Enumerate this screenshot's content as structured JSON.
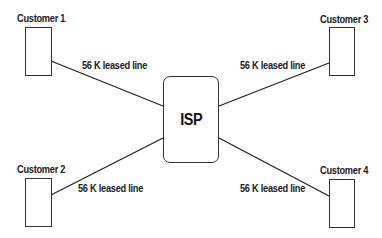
{
  "diagram": {
    "hub": {
      "label": "ISP"
    },
    "nodes": [
      {
        "id": "customer1",
        "label": "Customer 1"
      },
      {
        "id": "customer2",
        "label": "Customer 2"
      },
      {
        "id": "customer3",
        "label": "Customer 3"
      },
      {
        "id": "customer4",
        "label": "Customer 4"
      }
    ],
    "links": [
      {
        "from": "customer1",
        "to": "ISP",
        "label": "56 K leased line"
      },
      {
        "from": "customer2",
        "to": "ISP",
        "label": "56 K leased line"
      },
      {
        "from": "customer3",
        "to": "ISP",
        "label": "56 K leased line"
      },
      {
        "from": "customer4",
        "to": "ISP",
        "label": "56 K leased line"
      }
    ]
  }
}
